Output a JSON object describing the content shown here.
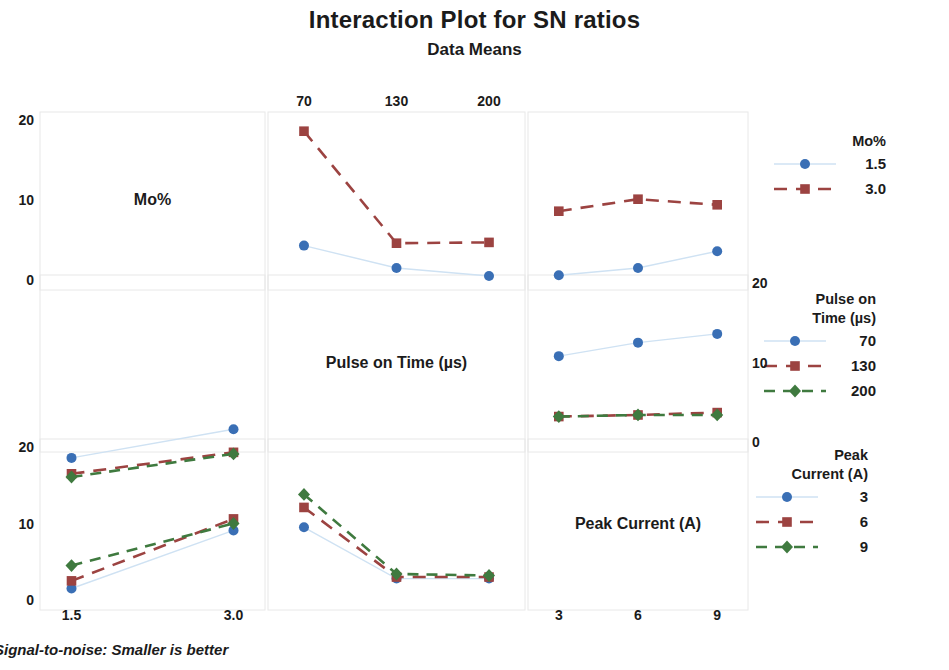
{
  "header": {
    "title": "Interaction Plot for SN ratios",
    "subtitle": "Data Means"
  },
  "footnote": "Signal-to-noise: Smaller is better",
  "colors": {
    "series1": "#3a6fb5",
    "series1_line": "#cfe2f3",
    "series2": "#9c4341",
    "series3": "#3f7a3f",
    "text": "#1b1b1b",
    "grid": "#e8e8e8"
  },
  "axes": {
    "row1_y_ticks": [
      "20",
      "10",
      "0"
    ],
    "row2_y_ticks": [
      "20",
      "10",
      "0"
    ],
    "row2_right_y_ticks": [
      "20",
      "10",
      "0"
    ],
    "col1_x_ticks": [
      "1.5",
      "3.0"
    ],
    "col2_x_ticks": [
      "70",
      "130",
      "200"
    ],
    "col3_x_ticks": [
      "3",
      "6",
      "9"
    ]
  },
  "factors": {
    "f1": "Mo%",
    "f2": "Pulse on Time (µs)",
    "f3": "Peak Current (A)"
  },
  "legends": [
    {
      "title_lines": [
        "Mo%"
      ],
      "entries": [
        {
          "label": "1.5",
          "marker": "circle",
          "color": "#3a6fb5",
          "dash": "solid"
        },
        {
          "label": "3.0",
          "marker": "square",
          "color": "#9c4341",
          "dash": "dashed"
        }
      ]
    },
    {
      "title_lines": [
        "Pulse on",
        "Time (µs)"
      ],
      "entries": [
        {
          "label": "70",
          "marker": "circle",
          "color": "#3a6fb5",
          "dash": "solid"
        },
        {
          "label": "130",
          "marker": "square",
          "color": "#9c4341",
          "dash": "dashed"
        },
        {
          "label": "200",
          "marker": "diamond",
          "color": "#3f7a3f",
          "dash": "dashed"
        }
      ]
    },
    {
      "title_lines": [
        "Peak",
        "Current (A)"
      ],
      "entries": [
        {
          "label": "3",
          "marker": "circle",
          "color": "#3a6fb5",
          "dash": "solid"
        },
        {
          "label": "6",
          "marker": "square",
          "color": "#9c4341",
          "dash": "dashed"
        },
        {
          "label": "9",
          "marker": "diamond",
          "color": "#3f7a3f",
          "dash": "dashed"
        }
      ]
    }
  ],
  "chart_data": {
    "type": "line",
    "title": "Interaction Plot for SN ratios",
    "subtitle": "Data Means",
    "ylabel": "SN ratio (Data Means)",
    "ylim": [
      -4,
      21
    ],
    "grid": false,
    "legend_position": "right",
    "panels": [
      {
        "id": "r1c1",
        "kind": "diagonal-label",
        "label": "Mo%",
        "row": 1,
        "col": 1
      },
      {
        "id": "r1c2",
        "kind": "interaction",
        "row": 1,
        "col": 2,
        "x": [
          "70",
          "130",
          "200"
        ],
        "xlabel": "Pulse on Time (µs)",
        "trace_factor": "Mo%",
        "series": [
          {
            "name": "1.5",
            "values": [
              4.3,
              1.5,
              0.5
            ]
          },
          {
            "name": "3.0",
            "values": [
              18.6,
              4.6,
              4.7
            ]
          }
        ]
      },
      {
        "id": "r1c3",
        "kind": "interaction",
        "row": 1,
        "col": 3,
        "x": [
          "3",
          "6",
          "9"
        ],
        "xlabel": "Peak Current (A)",
        "trace_factor": "Mo%",
        "series": [
          {
            "name": "1.5",
            "values": [
              0.6,
              1.5,
              3.6
            ]
          },
          {
            "name": "3.0",
            "values": [
              8.6,
              10.1,
              9.4
            ]
          }
        ]
      },
      {
        "id": "r2c2",
        "kind": "diagonal-label",
        "label": "Pulse on Time (µs)",
        "row": 2,
        "col": 2
      },
      {
        "id": "r2c3",
        "kind": "interaction",
        "row": 2,
        "col": 3,
        "x": [
          "3",
          "6",
          "9"
        ],
        "xlabel": "Peak Current (A)",
        "trace_factor": "Pulse on Time (µs)",
        "series": [
          {
            "name": "70",
            "values": [
              10.8,
              12.5,
              13.6
            ]
          },
          {
            "name": "130",
            "values": [
              3.2,
              3.4,
              3.7
            ]
          },
          {
            "name": "200",
            "values": [
              3.2,
              3.4,
              3.4
            ]
          }
        ]
      },
      {
        "id": "r3c1",
        "kind": "interaction",
        "row": 3,
        "col": 1,
        "x": [
          "1.5",
          "3.0"
        ],
        "xlabel": "Mo%",
        "trace_factor": "Peak Current (A)",
        "series": [
          {
            "name": "3",
            "values": [
              1.5,
              9.1
            ]
          },
          {
            "name": "6",
            "values": [
              2.5,
              10.6
            ]
          },
          {
            "name": "9",
            "values": [
              4.5,
              10.0
            ]
          }
        ]
      },
      {
        "id": "r3c2",
        "kind": "interaction",
        "row": 3,
        "col": 2,
        "x": [
          "70",
          "130",
          "200"
        ],
        "xlabel": "Pulse on Time (µs)",
        "trace_factor": "Peak Current (A)",
        "series": [
          {
            "name": "3",
            "values": [
              9.5,
              2.8,
              2.8
            ]
          },
          {
            "name": "6",
            "values": [
              12.1,
              3.0,
              3.0
            ]
          },
          {
            "name": "9",
            "values": [
              13.8,
              3.4,
              3.2
            ]
          }
        ]
      },
      {
        "id": "r3c3",
        "kind": "diagonal-label",
        "label": "Peak Current (A)",
        "row": 3,
        "col": 3
      },
      {
        "id": "r2c1",
        "kind": "interaction-upper-left",
        "row": 2,
        "col": 1,
        "x": [
          "1.5",
          "3.0"
        ],
        "xlabel": "Mo%",
        "trace_factor": "Pulse on Time (µs)",
        "series": [
          {
            "name": "70",
            "values": [
              -2.0,
              1.6
            ]
          },
          {
            "name": "130",
            "values": [
              -4.0,
              -1.3
            ]
          },
          {
            "name": "200",
            "values": [
              -4.4,
              -1.5
            ]
          }
        ]
      }
    ]
  }
}
